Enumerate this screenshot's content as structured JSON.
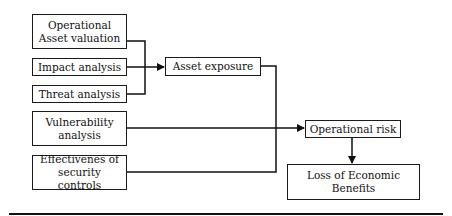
{
  "diagram": {
    "nodes": {
      "asset_valuation": {
        "label_line1": "Operational",
        "label_line2": "Asset valuation"
      },
      "impact_analysis": {
        "label": "Impact analysis"
      },
      "threat_analysis": {
        "label": "Threat analysis"
      },
      "asset_exposure": {
        "label": "Asset exposure"
      },
      "vulnerability_analysis": {
        "label_line1": "Vulnerability",
        "label_line2": "analysis"
      },
      "security_controls": {
        "label_line1": "Effectivenes of",
        "label_line2": "security controls"
      },
      "operational_risk": {
        "label": "Operational risk"
      },
      "loss_benefits": {
        "label_line1": "Loss of Economic",
        "label_line2": "Benefits"
      }
    },
    "edges": [
      {
        "from": [
          "asset_valuation",
          "impact_analysis",
          "threat_analysis"
        ],
        "to": "asset_exposure",
        "type": "arrow"
      },
      {
        "from": "asset_exposure",
        "to": "operational_risk",
        "type": "arrow"
      },
      {
        "from": "vulnerability_analysis",
        "to": "operational_risk",
        "type": "arrow"
      },
      {
        "from": "security_controls",
        "to": "operational_risk",
        "type": "arrow"
      },
      {
        "from": "operational_risk",
        "to": "loss_benefits",
        "type": "bidirectional"
      }
    ]
  }
}
